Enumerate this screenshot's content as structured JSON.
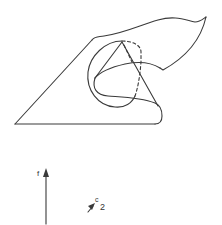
{
  "figure": {
    "line_color": "#3a3a3a",
    "background": "#ffffff"
  },
  "labels": {
    "vertical_arrow": "f",
    "small_arrow_letter": "c",
    "small_arrow_subscript": "2"
  }
}
